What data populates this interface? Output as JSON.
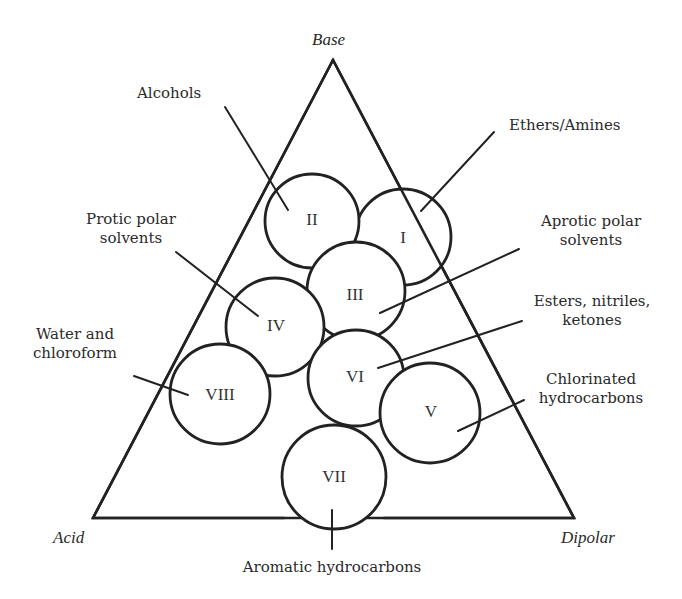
{
  "diagram": {
    "type": "solvent-classification-triangle",
    "colors": {
      "stroke": "#222222",
      "text": "#2a2a2a",
      "background": "#ffffff"
    },
    "triangle": {
      "vertices": {
        "top": {
          "label": "Base",
          "x": 333,
          "y": 60
        },
        "bottom_left": {
          "label": "Acid",
          "x": 93,
          "y": 518
        },
        "bottom_right": {
          "label": "Dipolar",
          "x": 574,
          "y": 518
        }
      }
    },
    "groups": [
      {
        "id": "I",
        "numeral": "I",
        "name": "Ethers/Amines",
        "lines": [
          "Ethers/Amines"
        ],
        "cx": 403,
        "cy": 237,
        "r": 48
      },
      {
        "id": "II",
        "numeral": "II",
        "name": "Alcohols",
        "lines": [
          "Alcohols"
        ],
        "cx": 312,
        "cy": 221,
        "r": 47
      },
      {
        "id": "III",
        "numeral": "III",
        "name": "Aprotic polar solvents",
        "lines": [
          "Aprotic polar",
          "solvents"
        ],
        "cx": 356,
        "cy": 291,
        "r": 49
      },
      {
        "id": "IV",
        "numeral": "IV",
        "name": "Protic polar solvents",
        "lines": [
          "Protic polar",
          "solvents"
        ],
        "cx": 275,
        "cy": 327,
        "r": 49
      },
      {
        "id": "V",
        "numeral": "V",
        "name": "Chlorinated hydrocarbons",
        "lines": [
          "Chlorinated",
          "hydrocarbons"
        ],
        "cx": 430,
        "cy": 413,
        "r": 50
      },
      {
        "id": "VI",
        "numeral": "VI",
        "name": "Esters, nitriles, ketones",
        "lines": [
          "Esters, nitriles,",
          "ketones"
        ],
        "cx": 356,
        "cy": 378,
        "r": 48
      },
      {
        "id": "VII",
        "numeral": "VII",
        "name": "Aromatic hydrocarbons",
        "lines": [
          "Aromatic hydrocarbons"
        ],
        "cx": 334,
        "cy": 477,
        "r": 52
      },
      {
        "id": "VIII",
        "numeral": "VIII",
        "name": "Water and chloroform",
        "lines": [
          "Water and",
          "chloroform"
        ],
        "cx": 220,
        "cy": 394,
        "r": 50
      }
    ]
  }
}
